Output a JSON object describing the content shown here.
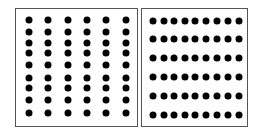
{
  "panels": [
    {
      "name": "left-panel",
      "box": {
        "x": 15,
        "y": 8,
        "w": 123,
        "h": 119
      },
      "columns": 6,
      "rows": 9,
      "dot_x": [
        29,
        48,
        68,
        87,
        106,
        126
      ],
      "dot_y": [
        20,
        32,
        43,
        53,
        65,
        78,
        88,
        100,
        113
      ]
    },
    {
      "name": "right-panel",
      "box": {
        "x": 141,
        "y": 8,
        "w": 107,
        "h": 119
      },
      "columns": 9,
      "rows": 6,
      "dot_x": [
        153,
        164,
        174,
        185,
        195,
        206,
        217,
        228,
        239
      ],
      "dot_y": [
        21,
        39,
        58,
        77,
        96,
        115
      ]
    }
  ],
  "colors": {
    "dot": "#000000",
    "border": "#555555",
    "background": "#ffffff"
  }
}
